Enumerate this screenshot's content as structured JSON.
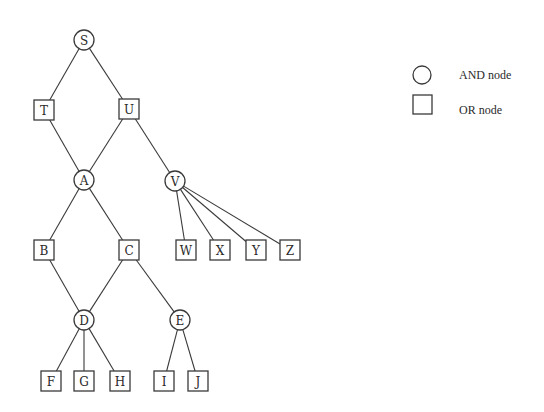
{
  "diagram": {
    "type": "and-or-tree",
    "colors": {
      "stroke": "#3a3a3a",
      "text": "#2a2a2a",
      "background": "#ffffff"
    },
    "nodes": [
      {
        "id": "S",
        "label": "S",
        "kind": "AND",
        "x": 84,
        "y": 40
      },
      {
        "id": "T",
        "label": "T",
        "kind": "OR",
        "x": 44,
        "y": 110
      },
      {
        "id": "U",
        "label": "U",
        "kind": "OR",
        "x": 129,
        "y": 109
      },
      {
        "id": "A",
        "label": "A",
        "kind": "AND",
        "x": 84,
        "y": 180
      },
      {
        "id": "V",
        "label": "V",
        "kind": "AND",
        "x": 175,
        "y": 181
      },
      {
        "id": "B",
        "label": "B",
        "kind": "OR",
        "x": 44,
        "y": 250
      },
      {
        "id": "C",
        "label": "C",
        "kind": "OR",
        "x": 129,
        "y": 250
      },
      {
        "id": "W",
        "label": "W",
        "kind": "OR",
        "x": 186,
        "y": 250
      },
      {
        "id": "X",
        "label": "X",
        "kind": "OR",
        "x": 220,
        "y": 250
      },
      {
        "id": "Y",
        "label": "Y",
        "kind": "OR",
        "x": 256,
        "y": 250
      },
      {
        "id": "Z",
        "label": "Z",
        "kind": "OR",
        "x": 290,
        "y": 250
      },
      {
        "id": "D",
        "label": "D",
        "kind": "AND",
        "x": 84,
        "y": 320
      },
      {
        "id": "E",
        "label": "E",
        "kind": "AND",
        "x": 180,
        "y": 320
      },
      {
        "id": "F",
        "label": "F",
        "kind": "OR",
        "x": 51,
        "y": 381
      },
      {
        "id": "G",
        "label": "G",
        "kind": "OR",
        "x": 84,
        "y": 381
      },
      {
        "id": "H",
        "label": "H",
        "kind": "OR",
        "x": 120,
        "y": 381
      },
      {
        "id": "I",
        "label": "I",
        "kind": "OR",
        "x": 164,
        "y": 381
      },
      {
        "id": "J",
        "label": "J",
        "kind": "OR",
        "x": 198,
        "y": 381
      }
    ],
    "edges": [
      [
        "S",
        "T"
      ],
      [
        "S",
        "U"
      ],
      [
        "T",
        "A"
      ],
      [
        "U",
        "A"
      ],
      [
        "U",
        "V"
      ],
      [
        "A",
        "B"
      ],
      [
        "A",
        "C"
      ],
      [
        "V",
        "W"
      ],
      [
        "V",
        "X"
      ],
      [
        "V",
        "Y"
      ],
      [
        "V",
        "Z"
      ],
      [
        "B",
        "D"
      ],
      [
        "C",
        "D"
      ],
      [
        "C",
        "E"
      ],
      [
        "D",
        "F"
      ],
      [
        "D",
        "G"
      ],
      [
        "D",
        "H"
      ],
      [
        "E",
        "I"
      ],
      [
        "E",
        "J"
      ]
    ]
  },
  "legend": {
    "items": [
      {
        "shape": "circle",
        "label": "AND node"
      },
      {
        "shape": "square",
        "label": "OR node"
      }
    ]
  }
}
